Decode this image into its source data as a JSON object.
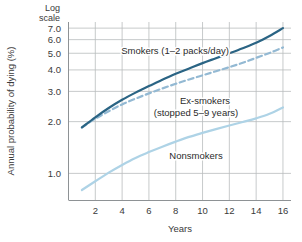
{
  "chart_data": {
    "type": "line",
    "title": "",
    "xlabel": "Years",
    "ylabel": "Annual probability of dying (%)",
    "scale_note": "Log\nscale",
    "scale_note_line1": "Log",
    "scale_note_line2": "scale",
    "yscale": "log",
    "ylim": [
      0.7,
      7.6
    ],
    "xlim": [
      0,
      16.6
    ],
    "grid": true,
    "legend_position": "inline-annotations",
    "xticks": [
      2,
      4,
      6,
      8,
      10,
      12,
      14,
      16
    ],
    "xtick_labels": [
      "2",
      "4",
      "6",
      "8",
      "10",
      "12",
      "14",
      "16"
    ],
    "yticks": [
      1.0,
      2.0,
      3.0,
      4.0,
      5.0,
      6.0,
      7.0
    ],
    "ytick_labels": [
      "1.0",
      "2.0",
      "3.0",
      "4.0",
      "5.0",
      "6.0",
      "7.0"
    ],
    "x": [
      1,
      2,
      3,
      4,
      5,
      6,
      7,
      8,
      9,
      10,
      11,
      12,
      13,
      14,
      15,
      16
    ],
    "series": [
      {
        "name": "Smokers (1–2 packs/day)",
        "label_line1": "Smokers (1–2 packs/day)",
        "color": "#2a6484",
        "style": "solid",
        "width": 2.2,
        "values": [
          1.85,
          2.12,
          2.4,
          2.68,
          2.95,
          3.22,
          3.5,
          3.8,
          4.08,
          4.38,
          4.68,
          5.0,
          5.35,
          5.75,
          6.3,
          7.0
        ]
      },
      {
        "name": "Ex-smokers (stopped 5–9 years)",
        "label_line1": "Ex-smokers",
        "label_line2": "(stopped 5–9 years)",
        "color": "#93b9d3",
        "style": "dashed",
        "width": 2.2,
        "values": [
          1.85,
          2.08,
          2.3,
          2.52,
          2.72,
          2.92,
          3.12,
          3.32,
          3.52,
          3.72,
          3.93,
          4.15,
          4.4,
          4.7,
          5.02,
          5.4
        ]
      },
      {
        "name": "Nonsmokers",
        "label_line1": "Nonsmokers",
        "color": "#aed3e6",
        "style": "solid",
        "width": 2.2,
        "values": [
          0.8,
          0.9,
          1.01,
          1.12,
          1.23,
          1.33,
          1.43,
          1.53,
          1.63,
          1.72,
          1.81,
          1.9,
          1.99,
          2.09,
          2.22,
          2.42
        ]
      }
    ],
    "annotations": [
      {
        "name": "smokers-label",
        "text": "Smokers (1–2 packs/day)",
        "x": 175,
        "y": 54
      },
      {
        "name": "exsmokers-label-line1",
        "text": "Ex-smokers",
        "x": 205,
        "y": 104
      },
      {
        "name": "exsmokers-label-line2",
        "text": "(stopped 5–9 years)",
        "x": 196,
        "y": 116
      },
      {
        "name": "nonsmokers-label",
        "text": "Nonsmokers",
        "x": 196,
        "y": 159
      }
    ],
    "colors": {
      "smokers": "#2a6484",
      "exsmokers": "#93b9d3",
      "nonsmokers": "#aed3e6",
      "grid": "#b9bcbe",
      "axis": "#8e9295",
      "text": "#3a3a3a",
      "background": "#ffffff"
    }
  }
}
